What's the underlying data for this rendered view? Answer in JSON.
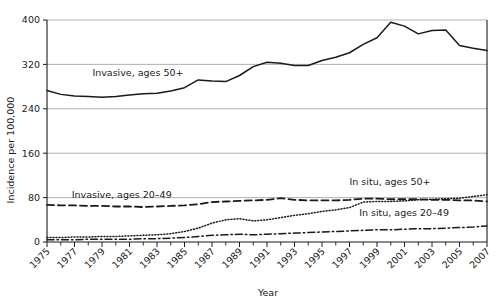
{
  "chart_data": {
    "type": "line",
    "title": "",
    "xlabel": "Year",
    "ylabel": "Incidence per 100,000",
    "xlim": [
      1975,
      2007
    ],
    "ylim": [
      0,
      400
    ],
    "yticks": [
      0,
      80,
      160,
      240,
      320,
      400
    ],
    "xticks": [
      1975,
      1977,
      1979,
      1981,
      1983,
      1985,
      1987,
      1989,
      1991,
      1993,
      1995,
      1997,
      1999,
      2001,
      2003,
      2005,
      2007
    ],
    "x": [
      1975,
      1976,
      1977,
      1978,
      1979,
      1980,
      1981,
      1982,
      1983,
      1984,
      1985,
      1986,
      1987,
      1988,
      1989,
      1990,
      1991,
      1992,
      1993,
      1994,
      1995,
      1996,
      1997,
      1998,
      1999,
      2000,
      2001,
      2002,
      2003,
      2004,
      2005,
      2006,
      2007
    ],
    "grid": "horizontal",
    "legend_position": "inline-annotations",
    "series": [
      {
        "name": "Invasive, ages 50+",
        "style": "solid",
        "color": "#1a1a1a",
        "label_x": 1978.3,
        "label_y": 300,
        "values": [
          273,
          266,
          263,
          262,
          261,
          262,
          265,
          267,
          268,
          272,
          278,
          292,
          290,
          289,
          300,
          316,
          324,
          322,
          318,
          318,
          327,
          333,
          341,
          356,
          368,
          396,
          389,
          375,
          381,
          382,
          354,
          349,
          345
        ]
      },
      {
        "name": "Invasive, ages 20–49",
        "style": "dashed",
        "color": "#1a1a1a",
        "label_x": 1976.8,
        "label_y": 80,
        "values": [
          67,
          66,
          66,
          65,
          65,
          64,
          64,
          63,
          64,
          65,
          66,
          68,
          72,
          73,
          74,
          75,
          76,
          79,
          76,
          75,
          75,
          75,
          76,
          78,
          78,
          77,
          77,
          77,
          76,
          76,
          75,
          75,
          73
        ]
      },
      {
        "name": "In situ, ages 50+",
        "style": "dotted",
        "color": "#1a1a1a",
        "label_x": 1997.0,
        "label_y": 103,
        "values": [
          8,
          8,
          9,
          9,
          10,
          10,
          11,
          12,
          13,
          15,
          19,
          25,
          34,
          40,
          42,
          38,
          40,
          44,
          48,
          51,
          55,
          58,
          62,
          72,
          73,
          73,
          74,
          76,
          77,
          78,
          79,
          82,
          85
        ]
      },
      {
        "name": "In situ, ages 20–49",
        "style": "dashdot",
        "color": "#1a1a1a",
        "label_x": 1997.7,
        "label_y": 47,
        "values": [
          4,
          4,
          4,
          5,
          5,
          5,
          5,
          6,
          6,
          7,
          8,
          10,
          12,
          13,
          14,
          13,
          14,
          15,
          16,
          17,
          18,
          19,
          20,
          21,
          22,
          22,
          23,
          24,
          24,
          25,
          26,
          27,
          29
        ]
      }
    ]
  },
  "axis": {
    "y_title": "Incidence per 100,000",
    "x_title": "Year"
  }
}
